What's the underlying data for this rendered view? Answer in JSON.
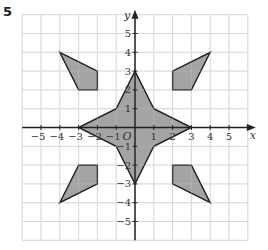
{
  "question_number": "5",
  "chart_data": {
    "type": "coordinate-grid",
    "xlabel": "x",
    "ylabel": "y",
    "origin_label": "O",
    "xlim": [
      -6,
      6
    ],
    "ylim": [
      -6,
      6
    ],
    "x_ticks": [
      -5,
      -4,
      -3,
      -2,
      -1,
      1,
      2,
      3,
      4,
      5
    ],
    "y_ticks": [
      -5,
      -4,
      -3,
      -2,
      -1,
      1,
      2,
      3,
      4,
      5
    ],
    "grid": true,
    "shapes": [
      {
        "name": "star",
        "vertices": [
          [
            0,
            3
          ],
          [
            1,
            1
          ],
          [
            3,
            0
          ],
          [
            1,
            -1
          ],
          [
            0,
            -3
          ],
          [
            -1,
            -1
          ],
          [
            -3,
            0
          ],
          [
            -1,
            1
          ]
        ]
      },
      {
        "name": "quad-top-left",
        "vertices": [
          [
            -4,
            4
          ],
          [
            -2,
            3
          ],
          [
            -2,
            2
          ],
          [
            -3,
            2
          ]
        ]
      },
      {
        "name": "quad-top-right",
        "vertices": [
          [
            4,
            4
          ],
          [
            3,
            2
          ],
          [
            2,
            2
          ],
          [
            2,
            3
          ]
        ]
      },
      {
        "name": "quad-bottom-right",
        "vertices": [
          [
            4,
            -4
          ],
          [
            2,
            -3
          ],
          [
            2,
            -2
          ],
          [
            3,
            -2
          ]
        ]
      },
      {
        "name": "quad-bottom-left",
        "vertices": [
          [
            -4,
            -4
          ],
          [
            -3,
            -2
          ],
          [
            -2,
            -2
          ],
          [
            -2,
            -3
          ]
        ]
      }
    ]
  },
  "colors": {
    "grid": "#cfcfcf",
    "axis": "#222222",
    "shape_fill": "#9a9a9a",
    "shape_stroke": "#1e1e1e"
  }
}
